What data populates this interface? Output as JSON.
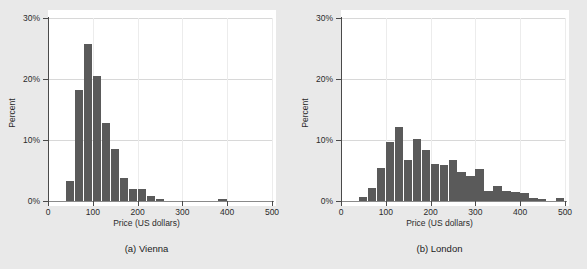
{
  "figure": {
    "background_color": "#e9e9e9",
    "bar_color": "#5a5a5a",
    "plot_background": "#ffffff",
    "grid_color": "#d8d8d8"
  },
  "panels": [
    {
      "caption": "(a) Vienna",
      "ylabel": "Percent",
      "xlabel": "Price (US dollars)",
      "ytick_labels": [
        "0%",
        "10%",
        "20%",
        "30%"
      ],
      "xtick_labels": [
        "0",
        "100",
        "200",
        "300",
        "400",
        "500"
      ]
    },
    {
      "caption": "(b) London",
      "ylabel": "Percent",
      "xlabel": "Price (US dollars)",
      "ytick_labels": [
        "0%",
        "10%",
        "20%",
        "30%"
      ],
      "xtick_labels": [
        "0",
        "100",
        "200",
        "300",
        "400",
        "500"
      ]
    }
  ],
  "chart_data": [
    {
      "type": "bar",
      "title": "(a) Vienna",
      "xlabel": "Price (US dollars)",
      "ylabel": "Percent",
      "xlim": [
        0,
        500
      ],
      "ylim": [
        0,
        30
      ],
      "yticks": [
        0,
        10,
        20,
        30
      ],
      "ytick_labels": [
        "0%",
        "10%",
        "20%",
        "30%"
      ],
      "xticks": [
        0,
        100,
        200,
        300,
        400,
        500
      ],
      "xtick_labels": [
        "0",
        "100",
        "200",
        "300",
        "400",
        "500"
      ],
      "grid": true,
      "legend": "none",
      "bin_width": 20,
      "bin_starts": [
        40,
        60,
        80,
        100,
        120,
        140,
        160,
        180,
        200,
        220,
        240,
        380
      ],
      "values": [
        3.2,
        18.2,
        25.8,
        20.5,
        12.8,
        8.6,
        3.7,
        1.9,
        1.9,
        0.9,
        0.3,
        0.3
      ]
    },
    {
      "type": "bar",
      "title": "(b) London",
      "xlabel": "Price (US dollars)",
      "ylabel": "Percent",
      "xlim": [
        0,
        500
      ],
      "ylim": [
        0,
        30
      ],
      "yticks": [
        0,
        10,
        20,
        30
      ],
      "ytick_labels": [
        "0%",
        "10%",
        "20%",
        "30%"
      ],
      "xticks": [
        0,
        100,
        200,
        300,
        400,
        500
      ],
      "xtick_labels": [
        "0",
        "100",
        "200",
        "300",
        "400",
        "500"
      ],
      "grid": true,
      "legend": "none",
      "bin_width": 20,
      "bin_starts": [
        40,
        60,
        80,
        100,
        120,
        140,
        160,
        180,
        200,
        220,
        240,
        260,
        280,
        300,
        320,
        340,
        360,
        380,
        400,
        420,
        440,
        480
      ],
      "values": [
        0.7,
        2.2,
        5.4,
        9.6,
        12.2,
        6.8,
        10.2,
        8.3,
        6.1,
        5.9,
        6.8,
        4.7,
        4.1,
        5.2,
        1.7,
        2.4,
        1.7,
        1.5,
        1.3,
        0.5,
        0.4,
        0.5
      ]
    }
  ]
}
